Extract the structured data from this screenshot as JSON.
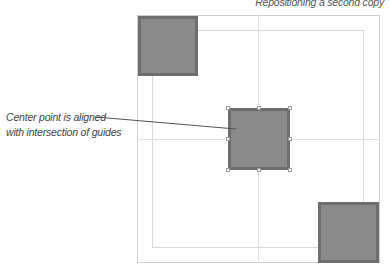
{
  "caption": "Repositioning a second copy",
  "callout": {
    "line1": "Center point is aligned",
    "line2": "with intersection of guides"
  },
  "colors": {
    "square_fill": "#8a8a8a",
    "square_border": "#6e6e6e",
    "guide": "#e2e2e2",
    "page_border": "#cfcfcf",
    "leader": "#555555"
  },
  "shapes": [
    {
      "name": "top-left-square",
      "x": 138,
      "y": 16,
      "size": 60
    },
    {
      "name": "center-square",
      "x": 228,
      "y": 108,
      "size": 62,
      "selected": true
    },
    {
      "name": "bottom-right-square",
      "x": 318,
      "y": 202,
      "size": 61
    }
  ]
}
